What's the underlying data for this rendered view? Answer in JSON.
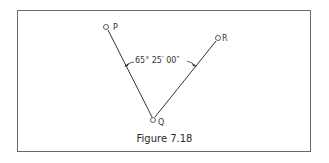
{
  "figure": {
    "caption": "Figure 7.18",
    "points": {
      "P": {
        "label": "P",
        "x": 107,
        "y": 27
      },
      "Q": {
        "label": "Q",
        "x": 153,
        "y": 120
      },
      "R": {
        "label": "R",
        "x": 218,
        "y": 38
      }
    },
    "angle_label": "65° 25′ 00″",
    "colors": {
      "line": "#333333",
      "frame": "#6a6a6a"
    }
  }
}
